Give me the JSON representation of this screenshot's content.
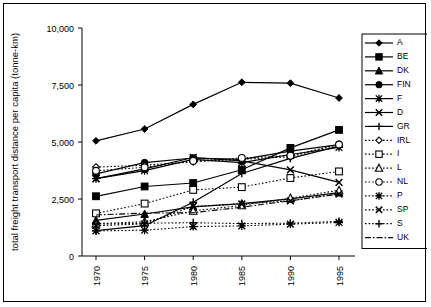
{
  "chart_data": {
    "type": "line",
    "title": "",
    "xlabel": "",
    "ylabel": "total freight transport distance per capita (tonne-km)",
    "x": [
      1970,
      1975,
      1980,
      1985,
      1990,
      1995
    ],
    "xtick_labels": [
      "1970",
      "1975",
      "1980",
      "1985",
      "1990",
      "1995"
    ],
    "ytick_labels": [
      "0",
      "2,500",
      "5,000",
      "7,500",
      "10,000"
    ],
    "yticks": [
      0,
      2500,
      5000,
      7500,
      10000
    ],
    "ylim": [
      0,
      10000
    ],
    "grid": false,
    "legend_position": "right",
    "series": [
      {
        "name": "A",
        "marker": "diamond-filled",
        "dash": "solid",
        "values": [
          5050,
          5570,
          6650,
          7620,
          7580,
          6930
        ]
      },
      {
        "name": "BE",
        "marker": "square-filled",
        "dash": "solid",
        "values": [
          2620,
          3050,
          3200,
          3780,
          4740,
          5530
        ]
      },
      {
        "name": "DK",
        "marker": "triangle-filled",
        "dash": "solid",
        "values": [
          1560,
          1840,
          2160,
          2300,
          2510,
          2780
        ]
      },
      {
        "name": "FIN",
        "marker": "circle-filled",
        "dash": "solid",
        "values": [
          3600,
          4090,
          4300,
          4240,
          4600,
          4880
        ]
      },
      {
        "name": "F",
        "marker": "asterisk",
        "dash": "solid",
        "values": [
          3390,
          3740,
          4240,
          4090,
          4450,
          4760
        ]
      },
      {
        "name": "D",
        "marker": "cross-x",
        "dash": "solid",
        "values": [
          3390,
          3820,
          4320,
          4170,
          3780,
          3230
        ]
      },
      {
        "name": "GR",
        "marker": "plus",
        "dash": "solid",
        "values": [
          1110,
          1330,
          2360,
          3620,
          4280,
          4820
        ]
      },
      {
        "name": "IRL",
        "marker": "diamond-open",
        "dash": "dotted",
        "values": [
          3900,
          3980,
          4130,
          4240,
          4350,
          4900
        ]
      },
      {
        "name": "I",
        "marker": "square-open",
        "dash": "dotted",
        "values": [
          1870,
          2300,
          2900,
          3020,
          3420,
          3710
        ]
      },
      {
        "name": "L",
        "marker": "triangle-open",
        "dash": "dotted",
        "values": [
          1420,
          1500,
          1980,
          2220,
          2540,
          2880
        ]
      },
      {
        "name": "NL",
        "marker": "circle-open",
        "dash": "dotted",
        "values": [
          3740,
          3890,
          4170,
          4300,
          4400,
          4890
        ]
      },
      {
        "name": "P",
        "marker": "asterisk-open",
        "dash": "dotted",
        "values": [
          1100,
          1130,
          1290,
          1320,
          1400,
          1470
        ]
      },
      {
        "name": "SP",
        "marker": "cross-x-open",
        "dash": "dotted",
        "values": [
          1330,
          1410,
          2180,
          2280,
          2420,
          2720
        ]
      },
      {
        "name": "S",
        "marker": "plus-open",
        "dash": "dotted",
        "values": [
          1400,
          1440,
          1460,
          1420,
          1440,
          1520
        ]
      },
      {
        "name": "UK",
        "marker": "none",
        "dash": "dashdot",
        "values": [
          1800,
          1880,
          1900,
          2140,
          2420,
          2720
        ]
      }
    ]
  },
  "axes": {
    "ylabel": "total freight transport distance per capita (tonne-km)",
    "ytick_labels": [
      "10,000",
      "7,500",
      "5,000",
      "2,500",
      "0"
    ],
    "xtick_labels": [
      "1970",
      "1975",
      "1980",
      "1985",
      "1990",
      "1995"
    ]
  },
  "legend": {
    "entries": [
      {
        "label": "A"
      },
      {
        "label": "BE"
      },
      {
        "label": "DK"
      },
      {
        "label": "FIN"
      },
      {
        "label": "F"
      },
      {
        "label": "D"
      },
      {
        "label": "GR"
      },
      {
        "label": "IRL"
      },
      {
        "label": "I"
      },
      {
        "label": "L"
      },
      {
        "label": "NL"
      },
      {
        "label": "P"
      },
      {
        "label": "SP"
      },
      {
        "label": "S"
      },
      {
        "label": "UK"
      }
    ]
  },
  "colors": {
    "ink": "#000000",
    "background": "#ffffff"
  }
}
